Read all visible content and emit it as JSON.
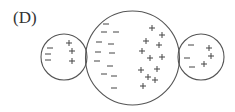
{
  "figure": {
    "label": "(D)",
    "colors": {
      "stroke": "#555555",
      "sign": "#444444",
      "label": "#333333",
      "background": "#ffffff"
    },
    "sign_size": 3,
    "circles": [
      {
        "name": "left-sphere",
        "cx": 64,
        "cy": 57,
        "r": 23,
        "negatives": [
          [
            50,
            48
          ],
          [
            48,
            54
          ],
          [
            48,
            60
          ]
        ],
        "positives": [
          [
            69,
            43
          ],
          [
            72,
            51
          ],
          [
            72,
            61
          ]
        ]
      },
      {
        "name": "center-sphere",
        "cx": 132.5,
        "cy": 58,
        "r": 47,
        "negatives": [
          [
            106,
            24
          ],
          [
            104,
            32
          ],
          [
            116,
            32
          ],
          [
            99,
            42
          ],
          [
            111,
            44
          ],
          [
            98,
            52
          ],
          [
            112,
            53
          ],
          [
            97,
            61
          ],
          [
            110,
            66
          ],
          [
            104,
            74
          ],
          [
            114,
            76
          ],
          [
            114,
            88
          ]
        ],
        "positives": [
          [
            152,
            28
          ],
          [
            162,
            35
          ],
          [
            146,
            41
          ],
          [
            159,
            45
          ],
          [
            142,
            51
          ],
          [
            162,
            57
          ],
          [
            150,
            58
          ],
          [
            141,
            70
          ],
          [
            157,
            69
          ],
          [
            148,
            77
          ],
          [
            155,
            80
          ],
          [
            143,
            86
          ]
        ]
      },
      {
        "name": "right-sphere",
        "cx": 201,
        "cy": 57,
        "r": 23,
        "negatives": [
          [
            191,
            45
          ],
          [
            187,
            58
          ],
          [
            192,
            67
          ]
        ],
        "positives": [
          [
            209,
            48
          ],
          [
            211,
            56
          ],
          [
            204,
            64
          ]
        ]
      }
    ]
  }
}
